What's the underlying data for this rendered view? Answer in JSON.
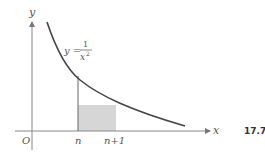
{
  "figure": {
    "number": "17.7",
    "function_label": "y =",
    "function_numerator": "1",
    "function_denominator": "x",
    "function_exponent": "2",
    "axes": {
      "x_label": "x",
      "y_label": "y",
      "origin_label": "O"
    },
    "ticks": {
      "n": "n",
      "n_plus_1": "n+1"
    },
    "colors": {
      "curve": "#444444",
      "axis": "#888888",
      "rect_fill": "#d6d6d6"
    }
  }
}
